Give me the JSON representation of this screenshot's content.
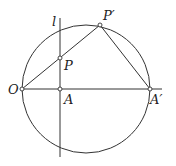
{
  "diagram": {
    "type": "geometry",
    "circle": {
      "cx": 86,
      "cy": 89,
      "r": 64
    },
    "line_l": {
      "label": "l",
      "x": 60,
      "y1": 18,
      "y2": 157
    },
    "axis": {
      "x1": 22,
      "x2": 162,
      "y": 89
    },
    "points": {
      "O": {
        "label": "O",
        "x": 22,
        "y": 89
      },
      "A": {
        "label": "A",
        "x": 60,
        "y": 89
      },
      "A_prime": {
        "label": "A′",
        "x": 150,
        "y": 89
      },
      "P": {
        "label": "P",
        "x": 60,
        "y": 58
      },
      "P_prime": {
        "label": "P′",
        "x": 100,
        "y": 25
      }
    },
    "segments": [
      {
        "from": "O",
        "to": "P_prime"
      },
      {
        "from": "P_prime",
        "to": "A_prime"
      }
    ],
    "colors": {
      "stroke": "#333333",
      "background": "#ffffff"
    }
  }
}
